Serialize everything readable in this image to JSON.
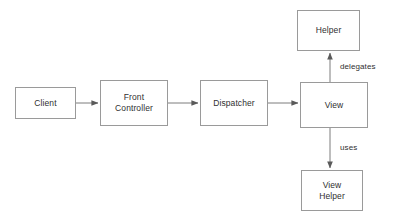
{
  "diagram": {
    "background_color": "#ffffff",
    "line_color": "#9a9a9a",
    "text_color": "#2f2f2f",
    "nodes": [
      {
        "id": "client",
        "label": "Client"
      },
      {
        "id": "front_controller",
        "label": "Front\nController"
      },
      {
        "id": "dispatcher",
        "label": "Dispatcher"
      },
      {
        "id": "view",
        "label": "View"
      },
      {
        "id": "helper",
        "label": "Helper"
      },
      {
        "id": "view_helper",
        "label": "View\nHelper"
      }
    ],
    "edges": [
      {
        "id": "client-to-front-controller",
        "from": "client",
        "to": "front_controller",
        "label": "",
        "direction": "right"
      },
      {
        "id": "front-controller-to-dispatcher",
        "from": "front_controller",
        "to": "dispatcher",
        "label": "",
        "direction": "right"
      },
      {
        "id": "dispatcher-to-view",
        "from": "dispatcher",
        "to": "view",
        "label": "",
        "direction": "right"
      },
      {
        "id": "view-to-helper",
        "from": "view",
        "to": "helper",
        "label": "delegates",
        "direction": "up"
      },
      {
        "id": "view-to-view-helper",
        "from": "view",
        "to": "view_helper",
        "label": "uses",
        "direction": "down"
      }
    ]
  }
}
